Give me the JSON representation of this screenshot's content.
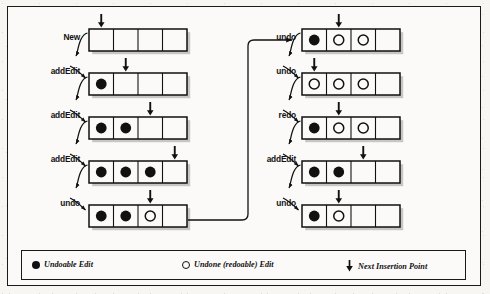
{
  "figure": {
    "cells_per_box": 4,
    "colors": {
      "ink": "#111111",
      "paper": "#fbfaf8",
      "shadow": "#9a9a9a"
    }
  },
  "left_column": {
    "steps": [
      {
        "label": "New",
        "cells": [
          "empty",
          "empty",
          "empty",
          "empty"
        ],
        "insertion_index": 0
      },
      {
        "label": "addEdit",
        "cells": [
          "filled",
          "empty",
          "empty",
          "empty"
        ],
        "insertion_index": 1
      },
      {
        "label": "addEdit",
        "cells": [
          "filled",
          "filled",
          "empty",
          "empty"
        ],
        "insertion_index": 2
      },
      {
        "label": "addEdit",
        "cells": [
          "filled",
          "filled",
          "filled",
          "empty"
        ],
        "insertion_index": 3
      },
      {
        "label": "undo",
        "cells": [
          "filled",
          "filled",
          "open",
          "empty"
        ],
        "insertion_index": 2
      }
    ]
  },
  "right_column": {
    "steps": [
      {
        "label": "undo",
        "cells": [
          "filled",
          "open",
          "open",
          "empty"
        ],
        "insertion_index": 1
      },
      {
        "label": "undo",
        "cells": [
          "open",
          "open",
          "open",
          "empty"
        ],
        "insertion_index": 0
      },
      {
        "label": "redo",
        "cells": [
          "filled",
          "open",
          "open",
          "empty"
        ],
        "insertion_index": 1
      },
      {
        "label": "addEdit",
        "cells": [
          "filled",
          "filled",
          "empty",
          "empty"
        ],
        "insertion_index": 2
      },
      {
        "label": "undo",
        "cells": [
          "filled",
          "open",
          "empty",
          "empty"
        ],
        "insertion_index": 1
      }
    ]
  },
  "legend": {
    "items": [
      {
        "marker": "filled-circle",
        "text": "Undoable Edit"
      },
      {
        "marker": "open-circle",
        "text": "Undone (redoable) Edit"
      },
      {
        "marker": "down-arrow",
        "text": "Next Insertion Point"
      }
    ]
  },
  "connector": {
    "from": "left_column.steps.4",
    "to": "right_column.steps.0",
    "style": "elbow-arrow"
  }
}
